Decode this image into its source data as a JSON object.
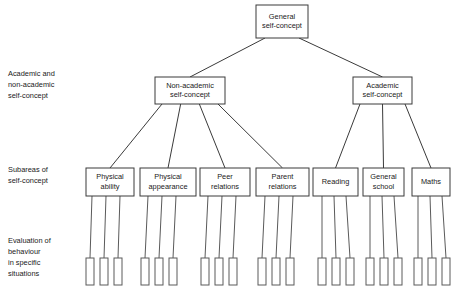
{
  "diagram": {
    "canvas": {
      "width": 461,
      "height": 300,
      "background": "#ffffff"
    },
    "colors": {
      "stroke": "#3a3a3a",
      "leaf_stroke": "#5a5a5a",
      "text": "#1a1a1a",
      "fill": "#ffffff"
    },
    "tier_labels": [
      {
        "id": "tier-2",
        "lines": [
          "Academic and",
          "non-academic",
          "self-concept"
        ],
        "x": 8,
        "y": 76
      },
      {
        "id": "tier-3",
        "lines": [
          "Subareas of",
          "self-concept"
        ],
        "x": 8,
        "y": 172
      },
      {
        "id": "tier-4",
        "lines": [
          "Evaluation of",
          "behaviour",
          "in specific",
          "situations"
        ],
        "x": 8,
        "y": 243
      }
    ],
    "nodes": {
      "root": {
        "id": "general-self-concept",
        "lines": [
          "General",
          "self-concept"
        ],
        "x": 256,
        "y": 5,
        "w": 52,
        "h": 33
      },
      "level2": [
        {
          "id": "non-academic-self-concept",
          "lines": [
            "Non-academic",
            "self-concept"
          ],
          "x": 155,
          "y": 77,
          "w": 70,
          "h": 27
        },
        {
          "id": "academic-self-concept",
          "lines": [
            "Academic",
            "self-concept"
          ],
          "x": 353,
          "y": 77,
          "w": 59,
          "h": 27
        }
      ],
      "level3": [
        {
          "id": "physical-ability",
          "lines": [
            "Physical",
            "ability"
          ],
          "x": 86,
          "y": 168,
          "w": 48,
          "h": 28,
          "parent": "non-academic-self-concept"
        },
        {
          "id": "physical-appearance",
          "lines": [
            "Physical",
            "appearance"
          ],
          "x": 140,
          "y": 168,
          "w": 56,
          "h": 28,
          "parent": "non-academic-self-concept"
        },
        {
          "id": "peer-relations",
          "lines": [
            "Peer",
            "relations"
          ],
          "x": 200,
          "y": 168,
          "w": 50,
          "h": 28,
          "parent": "non-academic-self-concept"
        },
        {
          "id": "parent-relations",
          "lines": [
            "Parent",
            "relations"
          ],
          "x": 256,
          "y": 168,
          "w": 53,
          "h": 28,
          "parent": "non-academic-self-concept"
        },
        {
          "id": "reading",
          "lines": [
            "Reading"
          ],
          "x": 313,
          "y": 168,
          "w": 45,
          "h": 28,
          "parent": "academic-self-concept"
        },
        {
          "id": "general-school",
          "lines": [
            "General",
            "school"
          ],
          "x": 363,
          "y": 168,
          "w": 41,
          "h": 28,
          "parent": "academic-self-concept"
        },
        {
          "id": "maths",
          "lines": [
            "Maths"
          ],
          "x": 412,
          "y": 168,
          "w": 38,
          "h": 28,
          "parent": "academic-self-concept"
        }
      ],
      "leaf_groups": [
        {
          "parent": "physical-ability",
          "rects": [
            {
              "x": 86,
              "y": 258
            },
            {
              "x": 100,
              "y": 258
            },
            {
              "x": 114,
              "y": 258
            }
          ],
          "anchors": [
            92,
            106,
            120
          ]
        },
        {
          "parent": "physical-appearance",
          "rects": [
            {
              "x": 141,
              "y": 258
            },
            {
              "x": 155,
              "y": 258
            },
            {
              "x": 169,
              "y": 258
            }
          ],
          "anchors": [
            148,
            162,
            176
          ]
        },
        {
          "parent": "peer-relations",
          "rects": [
            {
              "x": 201,
              "y": 258
            },
            {
              "x": 215,
              "y": 258
            },
            {
              "x": 229,
              "y": 258
            }
          ],
          "anchors": [
            208,
            222,
            236
          ]
        },
        {
          "parent": "parent-relations",
          "rects": [
            {
              "x": 258,
              "y": 258
            },
            {
              "x": 272,
              "y": 258
            },
            {
              "x": 286,
              "y": 258
            }
          ],
          "anchors": [
            265,
            279,
            293
          ]
        },
        {
          "parent": "reading",
          "rects": [
            {
              "x": 318,
              "y": 258
            },
            {
              "x": 332,
              "y": 258
            },
            {
              "x": 346,
              "y": 258
            }
          ],
          "anchors": [
            322,
            334,
            346
          ]
        },
        {
          "parent": "general-school",
          "rects": [
            {
              "x": 366,
              "y": 258
            },
            {
              "x": 380,
              "y": 258
            },
            {
              "x": 394,
              "y": 258
            }
          ],
          "anchors": [
            370,
            382,
            394
          ]
        },
        {
          "parent": "maths",
          "rects": [
            {
              "x": 414,
              "y": 258
            },
            {
              "x": 428,
              "y": 258
            },
            {
              "x": 442,
              "y": 258
            }
          ],
          "anchors": [
            418,
            430,
            442
          ]
        }
      ],
      "leaf_rect_size": {
        "w": 8,
        "h": 27
      }
    }
  }
}
